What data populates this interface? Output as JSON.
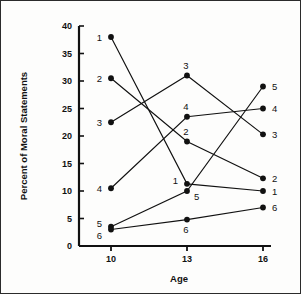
{
  "figure": {
    "background_color": "#fdfdfc",
    "border_color": "#2b2b2b",
    "ink_color": "#111111"
  },
  "chart_data": {
    "type": "line",
    "title": "",
    "xlabel": "Age",
    "ylabel": "Percent of Moral Statements",
    "categories": [
      "10",
      "13",
      "16"
    ],
    "x": [
      10,
      13,
      16
    ],
    "xlim": [
      10,
      16
    ],
    "ylim": [
      0,
      40
    ],
    "yticks": [
      "0",
      "5",
      "10",
      "15",
      "20",
      "25",
      "30",
      "35",
      "40"
    ],
    "ytick_values": [
      0,
      5,
      10,
      15,
      20,
      25,
      30,
      35,
      40
    ],
    "xticks": [
      "10",
      "13",
      "16"
    ],
    "grid": false,
    "legend": "none",
    "marker": "filled-circle",
    "series": [
      {
        "name": "1",
        "values": [
          38.0,
          11.3,
          10.0
        ],
        "label_left": "1",
        "label_mid": "1",
        "label_right": "1"
      },
      {
        "name": "2",
        "values": [
          30.5,
          19.0,
          12.3
        ],
        "label_left": "2",
        "label_mid": "2",
        "label_right": "2"
      },
      {
        "name": "3",
        "values": [
          22.5,
          31.0,
          20.3
        ],
        "label_left": "3",
        "label_mid": "3",
        "label_right": "3"
      },
      {
        "name": "4",
        "values": [
          10.5,
          23.5,
          25.0
        ],
        "label_left": "4",
        "label_mid": "4",
        "label_right": "4"
      },
      {
        "name": "5",
        "values": [
          3.5,
          10.0,
          29.0
        ],
        "label_left": "5",
        "label_mid": "5",
        "label_right": "5"
      },
      {
        "name": "6",
        "values": [
          3.0,
          4.8,
          7.0
        ],
        "label_left": "6",
        "label_mid": "6",
        "label_right": "6"
      }
    ],
    "point_labels": [
      {
        "text": "1",
        "x": 10,
        "y": 38.0,
        "pos": "left"
      },
      {
        "text": "2",
        "x": 10,
        "y": 30.5,
        "pos": "left"
      },
      {
        "text": "3",
        "x": 10,
        "y": 22.5,
        "pos": "left"
      },
      {
        "text": "4",
        "x": 10,
        "y": 10.5,
        "pos": "left"
      },
      {
        "text": "5",
        "x": 10,
        "y": 3.5,
        "pos": "left-above"
      },
      {
        "text": "6",
        "x": 10,
        "y": 3.0,
        "pos": "left-below"
      },
      {
        "text": "3",
        "x": 13,
        "y": 31.0,
        "pos": "above"
      },
      {
        "text": "4",
        "x": 13,
        "y": 23.5,
        "pos": "above"
      },
      {
        "text": "2",
        "x": 13,
        "y": 19.0,
        "pos": "above"
      },
      {
        "text": "1",
        "x": 13,
        "y": 11.3,
        "pos": "left-above"
      },
      {
        "text": "5",
        "x": 13,
        "y": 10.0,
        "pos": "right-below"
      },
      {
        "text": "6",
        "x": 13,
        "y": 4.8,
        "pos": "below"
      },
      {
        "text": "5",
        "x": 16,
        "y": 29.0,
        "pos": "right"
      },
      {
        "text": "4",
        "x": 16,
        "y": 25.0,
        "pos": "right"
      },
      {
        "text": "3",
        "x": 16,
        "y": 20.3,
        "pos": "right"
      },
      {
        "text": "2",
        "x": 16,
        "y": 12.3,
        "pos": "right"
      },
      {
        "text": "1",
        "x": 16,
        "y": 10.0,
        "pos": "right"
      },
      {
        "text": "6",
        "x": 16,
        "y": 7.0,
        "pos": "right"
      }
    ]
  }
}
